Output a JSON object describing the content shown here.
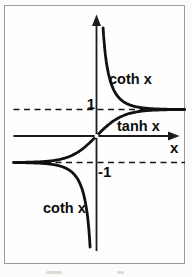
{
  "figure": {
    "labels": {
      "curve_upper": "coth x",
      "curve_tanh": "tanh x",
      "curve_lower": "coth x",
      "tick_pos": "1",
      "tick_neg": "-1",
      "axis_x": "x"
    }
  },
  "chart_data": {
    "type": "line",
    "title": "",
    "xlabel": "x",
    "ylabel": "",
    "xlim": [
      -3.2,
      3.4
    ],
    "ylim": [
      -4.5,
      4.6
    ],
    "grid": false,
    "legend_position": "inline-annotations",
    "series": [
      {
        "name": "tanh x",
        "fn": "tanh",
        "domain": [
          -3.15,
          3.35
        ],
        "label": "tanh x"
      },
      {
        "name": "coth x (x>0)",
        "fn": "coth",
        "domain": [
          0.25,
          3.35
        ],
        "label": "coth x"
      },
      {
        "name": "coth x (x<0)",
        "fn": "coth",
        "domain": [
          -3.15,
          -0.243
        ],
        "label": "coth x"
      }
    ],
    "asymptotes_y": [
      1,
      -1
    ],
    "asymptote_style": "dashed",
    "tick_labels_y": [
      "1",
      "-1"
    ],
    "open_point_at": [
      0,
      0
    ],
    "annotations": [
      "coth x",
      "tanh x",
      "coth x",
      "1",
      "-1",
      "x"
    ]
  }
}
